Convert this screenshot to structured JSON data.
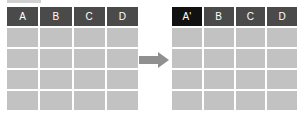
{
  "before": {
    "headers": [
      "A",
      "B",
      "C",
      "D"
    ],
    "rows": 4
  },
  "after": {
    "headers": [
      "A'",
      "B",
      "C",
      "D"
    ],
    "rows": 4,
    "highlighted_column": 0
  },
  "colors": {
    "header": "#4a4a4a",
    "header_highlight": "#111111",
    "cell": "#c2c2c2",
    "arrow": "#909090"
  },
  "icons": {
    "arrow": "arrow-right-icon"
  }
}
